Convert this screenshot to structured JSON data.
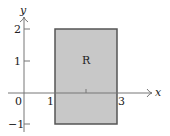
{
  "figure": {
    "type": "region-diagram",
    "axes": {
      "x_label": "x",
      "y_label": "y",
      "x_ticks": [
        {
          "value": 0,
          "label": "0"
        },
        {
          "value": 1,
          "label": "1"
        },
        {
          "value": 2,
          "label": ""
        },
        {
          "value": 3,
          "label": "3"
        }
      ],
      "y_ticks": [
        {
          "value": -1,
          "label": "−1"
        },
        {
          "value": 1,
          "label": "1"
        },
        {
          "value": 2,
          "label": "2"
        }
      ]
    },
    "region": {
      "label": "R",
      "x_min": 1,
      "x_max": 3,
      "y_min": -1,
      "y_max": 2,
      "fill_color": "#c8c8c8",
      "stroke_color": "#555555"
    },
    "axis_color": "#777777"
  }
}
